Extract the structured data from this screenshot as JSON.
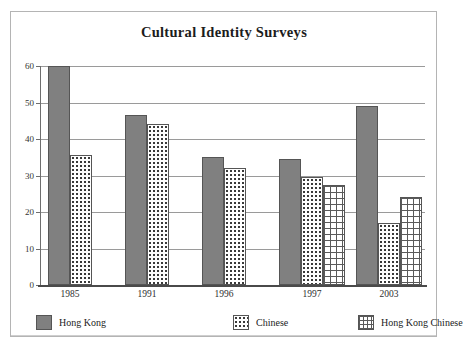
{
  "chart_data": {
    "type": "bar",
    "title": "Cultural Identity Surveys",
    "xlabel": "",
    "ylabel": "",
    "ylim": [
      0,
      60
    ],
    "yticks": [
      0,
      10,
      20,
      30,
      40,
      50,
      60
    ],
    "grid": true,
    "legend_position": "bottom",
    "categories": [
      "1985",
      "1991",
      "1996",
      "1997",
      "2003"
    ],
    "series": [
      {
        "name": "Hong Kong",
        "pattern": "solid",
        "color": "#808080",
        "values": [
          60,
          46.5,
          35,
          34.5,
          49
        ]
      },
      {
        "name": "Chinese",
        "pattern": "dots",
        "color": "#ffffff",
        "values": [
          35.5,
          44,
          32,
          29.5,
          17
        ]
      },
      {
        "name": "Hong Kong Chinese",
        "pattern": "grid",
        "color": "#ffffff",
        "values": [
          null,
          null,
          null,
          27.5,
          24
        ]
      }
    ]
  },
  "legend": {
    "items": [
      {
        "label": "Hong Kong",
        "pattern": "solid"
      },
      {
        "label": "Chinese",
        "pattern": "dots"
      },
      {
        "label": "Hong Kong Chinese",
        "pattern": "grid"
      }
    ]
  },
  "colors": {
    "bar_solid": "#808080",
    "bar_outline": "#555555",
    "gridline": "#9a9a9a",
    "axis": "#4a4a4a",
    "frame": "#b4b4b4",
    "text": "#1c1c1c",
    "background": "#ffffff"
  }
}
